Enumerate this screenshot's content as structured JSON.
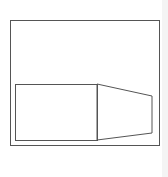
{
  "diagram": {
    "stroke_color": "#555555",
    "outer_frame": {
      "x": 10,
      "y": 20,
      "width": 149,
      "height": 125
    },
    "inner_rect": {
      "x": 15,
      "y": 84,
      "width": 82,
      "height": 56
    },
    "trapezoid": {
      "points": "97,84 152,96 152,133 97,140"
    }
  }
}
